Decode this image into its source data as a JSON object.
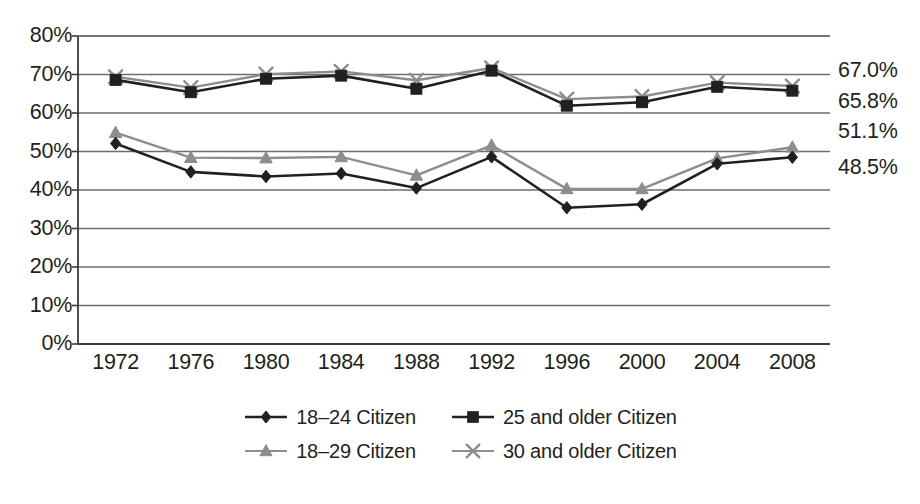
{
  "chart_data": {
    "type": "line",
    "title": "",
    "subtitle": "",
    "xlabel": "",
    "ylabel": "",
    "categories": [
      "1972",
      "1976",
      "1980",
      "1984",
      "1988",
      "1992",
      "1996",
      "2000",
      "2004",
      "2008"
    ],
    "x": [
      1972,
      1976,
      1980,
      1984,
      1988,
      1992,
      1996,
      2000,
      2004,
      2008
    ],
    "ylim": [
      0,
      80
    ],
    "yticks": [
      0,
      10,
      20,
      30,
      40,
      50,
      60,
      70,
      80
    ],
    "ytick_labels": [
      "0%",
      "10%",
      "20%",
      "30%",
      "40%",
      "50%",
      "60%",
      "70%",
      "80%"
    ],
    "grid": true,
    "legend_position": "bottom",
    "series": [
      {
        "name": "18–24 Citizen",
        "marker": "diamond",
        "color": "#231f20",
        "values": [
          52.1,
          44.7,
          43.5,
          44.3,
          40.5,
          48.6,
          35.4,
          36.3,
          46.8,
          48.5
        ],
        "end_label": "48.5%"
      },
      {
        "name": "25 and older Citizen",
        "marker": "square",
        "color": "#231f20",
        "values": [
          68.6,
          65.4,
          68.9,
          69.7,
          66.3,
          71.0,
          61.9,
          62.8,
          66.8,
          65.8
        ],
        "end_label": "65.8%"
      },
      {
        "name": "18–29 Citizen",
        "marker": "triangle",
        "color": "#8d8d8d",
        "values": [
          54.9,
          48.4,
          48.3,
          48.6,
          43.8,
          51.6,
          40.3,
          40.3,
          48.2,
          51.1
        ],
        "end_label": "51.1%"
      },
      {
        "name": "30 and older Citizen",
        "marker": "x",
        "color": "#8d8d8d",
        "values": [
          69.4,
          66.6,
          70.1,
          70.8,
          68.5,
          71.7,
          63.6,
          64.3,
          67.9,
          67.0
        ],
        "end_label": "67.0%"
      }
    ],
    "data_labels": [
      {
        "text": "67.0%",
        "value": 67.0
      },
      {
        "text": "65.8%",
        "value": 65.8
      },
      {
        "text": "51.1%",
        "value": 51.1
      },
      {
        "text": "48.5%",
        "value": 48.5
      }
    ]
  },
  "legend": {
    "rows": [
      [
        {
          "label": "18–24 Citizen",
          "marker": "diamond",
          "color": "#231f20"
        },
        {
          "label": "25 and older Citizen",
          "marker": "square",
          "color": "#231f20"
        }
      ],
      [
        {
          "label": "18–29 Citizen",
          "marker": "triangle",
          "color": "#8d8d8d"
        },
        {
          "label": "30 and older Citizen",
          "marker": "x",
          "color": "#8d8d8d"
        }
      ]
    ]
  },
  "colors": {
    "dark": "#231f20",
    "gray": "#8d8d8d",
    "gridline": "#6d6d6d",
    "axis": "#3a3a3a",
    "background": "#ffffff"
  }
}
